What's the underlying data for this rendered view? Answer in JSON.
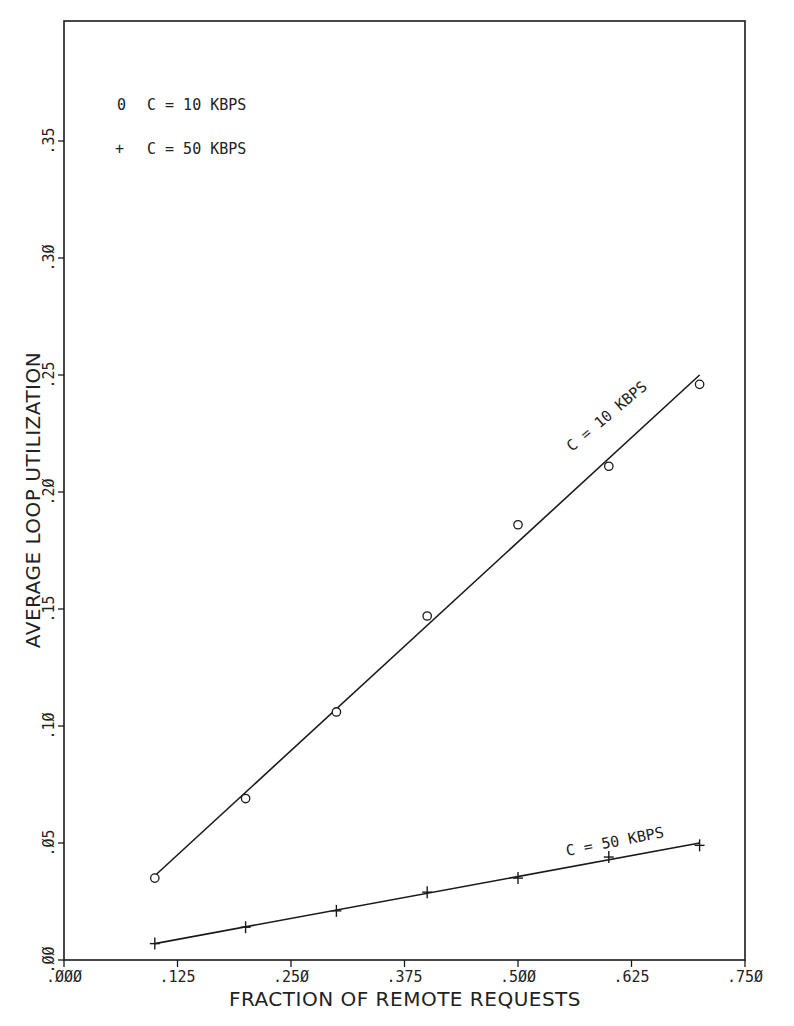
{
  "chart_data": {
    "type": "line",
    "title": "",
    "xlabel": "FRACTION OF REMOTE REQUESTS",
    "ylabel": "AVERAGE LOOP UTILIZATION",
    "xlim": [
      0,
      0.75
    ],
    "ylim": [
      0,
      0.4
    ],
    "grid": false,
    "legend_position": "upper-left",
    "x_ticks": [
      ".000",
      ".125",
      ".250",
      ".375",
      ".500",
      ".625",
      ".750"
    ],
    "y_ticks": [
      ".00",
      ".05",
      ".10",
      ".15",
      ".20",
      ".25",
      ".30",
      ".35"
    ],
    "x": [
      0.1,
      0.2,
      0.3,
      0.4,
      0.5,
      0.6,
      0.7
    ],
    "series": [
      {
        "name": "C = 10 KBPS",
        "marker": "o",
        "legend_symbol": "0",
        "curve_label": "C = 10 KBPS",
        "values": [
          0.035,
          0.069,
          0.106,
          0.147,
          0.186,
          0.211,
          0.246
        ],
        "fit_line": [
          [
            0.1,
            0.036
          ],
          [
            0.7,
            0.25
          ]
        ]
      },
      {
        "name": "C = 50 KBPS",
        "marker": "+",
        "legend_symbol": "+",
        "curve_label": "C = 50 KBPS",
        "values": [
          0.007,
          0.014,
          0.021,
          0.029,
          0.035,
          0.044,
          0.049
        ],
        "fit_line": [
          [
            0.1,
            0.007
          ],
          [
            0.7,
            0.05
          ]
        ]
      }
    ]
  },
  "colors": {
    "ink": "#1a1a1a",
    "background": "#ffffff"
  }
}
